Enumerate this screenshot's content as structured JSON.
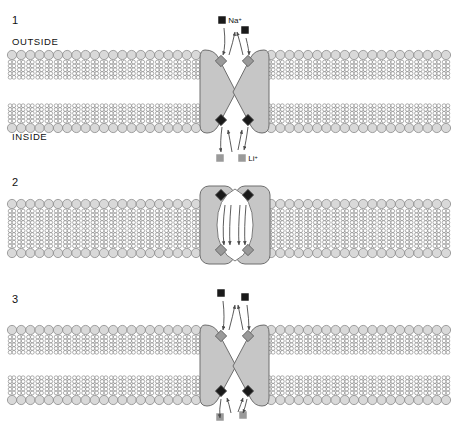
{
  "figure": {
    "background": "#ffffff"
  },
  "colors": {
    "lipid_head_fill": "#d9d9d9",
    "lipid_head_stroke": "#8c8c8c",
    "lipid_tail_stroke": "#8c8c8c",
    "protein_fill": "#c6c6c6",
    "protein_stroke": "#6e6e6e",
    "cavity_fill": "#ffffff",
    "site_gray_fill": "#9a9a9a",
    "site_black_fill": "#1a1a1a",
    "ion_black_fill": "#1a1a1a",
    "ion_gray_fill": "#9a9a9a",
    "arrow_stroke": "#4a4a4a",
    "text": "#111111"
  },
  "geometry": {
    "lipid_head_radius": 4.6,
    "lipid_spacing": 9.2,
    "tail_bead_count": 5,
    "tail_bead_radius": 1.9,
    "membrane_left_start": 12,
    "membrane_left_count": 21,
    "membrane_right_start": 262,
    "membrane_right_count": 21
  },
  "panels": [
    {
      "id": "panel-1",
      "number": "1",
      "state": "outward-open",
      "top": 14,
      "membrane_top": 55,
      "membrane_bottom": 128,
      "labels": {
        "outside": "OUTSIDE",
        "inside": "INSIDE"
      },
      "ions": [
        {
          "name": "ion-na-left",
          "label": "Na",
          "charge": "+",
          "show_label": true,
          "color": "black",
          "x": 222,
          "y": 20
        },
        {
          "name": "ion-na-right",
          "label": "",
          "charge": "",
          "show_label": false,
          "color": "black",
          "x": 245,
          "y": 30
        },
        {
          "name": "ion-li-left",
          "label": "",
          "charge": "",
          "show_label": false,
          "color": "gray",
          "x": 220,
          "y": 158
        },
        {
          "name": "ion-li-right",
          "label": "Li",
          "charge": "+",
          "show_label": true,
          "color": "gray",
          "x": 242,
          "y": 158
        }
      ],
      "binding_sites": [
        {
          "name": "site-outward-left",
          "color": "gray",
          "x": 221,
          "y": 61
        },
        {
          "name": "site-outward-right",
          "color": "gray",
          "x": 248,
          "y": 61
        },
        {
          "name": "site-inward-left",
          "color": "black",
          "x": 221,
          "y": 120
        },
        {
          "name": "site-inward-right",
          "color": "black",
          "x": 248,
          "y": 120
        }
      ]
    },
    {
      "id": "panel-2",
      "number": "2",
      "state": "occluded",
      "top": 176,
      "membrane_top": 204,
      "membrane_bottom": 253,
      "labels": {
        "outside": "",
        "inside": ""
      },
      "ions": [],
      "binding_sites": [
        {
          "name": "site-occluded-top-left",
          "color": "black",
          "x": 221,
          "y": 195
        },
        {
          "name": "site-occluded-top-right",
          "color": "black",
          "x": 248,
          "y": 195
        },
        {
          "name": "site-occluded-bottom-left",
          "color": "gray",
          "x": 221,
          "y": 250
        },
        {
          "name": "site-occluded-bottom-right",
          "color": "gray",
          "x": 248,
          "y": 250
        }
      ]
    },
    {
      "id": "panel-3",
      "number": "3",
      "state": "outward-open",
      "top": 293,
      "membrane_top": 330,
      "membrane_bottom": 400,
      "labels": {
        "outside": "",
        "inside": ""
      },
      "ions": [
        {
          "name": "ion-top-left",
          "label": "",
          "charge": "",
          "show_label": false,
          "color": "black",
          "x": 221,
          "y": 293
        },
        {
          "name": "ion-top-right",
          "label": "",
          "charge": "",
          "show_label": false,
          "color": "black",
          "x": 245,
          "y": 297
        },
        {
          "name": "ion-bottom-left",
          "label": "",
          "charge": "",
          "show_label": false,
          "color": "gray",
          "x": 220,
          "y": 417
        },
        {
          "name": "ion-bottom-right",
          "label": "",
          "charge": "",
          "show_label": false,
          "color": "gray",
          "x": 243,
          "y": 415
        }
      ],
      "binding_sites": [
        {
          "name": "site-outward-left",
          "color": "gray",
          "x": 221,
          "y": 336
        },
        {
          "name": "site-outward-right",
          "color": "gray",
          "x": 248,
          "y": 336
        },
        {
          "name": "site-inward-left",
          "color": "black",
          "x": 221,
          "y": 391
        },
        {
          "name": "site-inward-right",
          "color": "black",
          "x": 248,
          "y": 391
        }
      ]
    }
  ]
}
